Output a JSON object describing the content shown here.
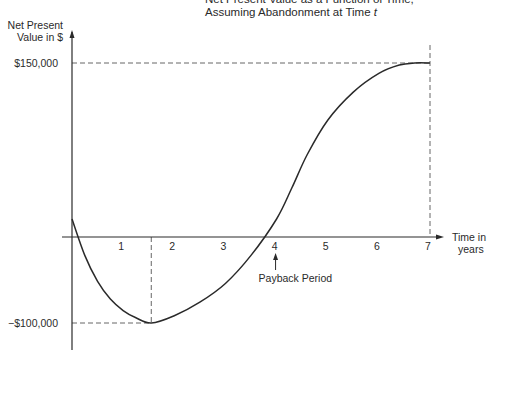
{
  "chart_data": {
    "type": "line",
    "title": "Net Present Value as a Function of Time,",
    "title_line2": "Assuming Abandonment at Time ",
    "title_var": "t",
    "ylabel_line1": "Net Present",
    "ylabel_line2": "Value in $",
    "xlabel_line1": "Time in",
    "xlabel_line2": "years",
    "xlim": [
      0,
      7
    ],
    "ylim": [
      -100000,
      150000
    ],
    "x_ticks": [
      1,
      2,
      3,
      4,
      5,
      6,
      7
    ],
    "x_tick_labels": [
      "1",
      "2",
      "3",
      "4",
      "5",
      "6",
      "7"
    ],
    "y_tick_labels": [
      {
        "value": 150000,
        "label": "$150,000"
      },
      {
        "value": -100000,
        "label": "−$100,000"
      }
    ],
    "series": [
      {
        "name": "Net Present Value",
        "x": [
          0,
          0.25,
          0.5,
          0.75,
          1.0,
          1.25,
          1.55,
          2.0,
          2.5,
          3.0,
          3.5,
          4.0,
          4.3,
          4.6,
          5.0,
          5.5,
          6.0,
          6.4,
          6.7,
          7.0
        ],
        "y": [
          0,
          -35000,
          -60000,
          -77000,
          -88000,
          -95000,
          -100000,
          -93000,
          -80000,
          -62000,
          -35000,
          0,
          30000,
          62000,
          95000,
          122000,
          140000,
          148000,
          150000,
          150000
        ]
      }
    ],
    "reference_lines": [
      {
        "type": "horizontal",
        "value": 150000,
        "style": "dashed"
      },
      {
        "type": "horizontal",
        "value": -100000,
        "style": "dashed"
      },
      {
        "type": "vertical",
        "value": 1.55,
        "style": "dashed"
      },
      {
        "type": "vertical",
        "value": 7,
        "style": "dashed"
      }
    ],
    "annotations": [
      {
        "text": "Payback Period",
        "x": 4,
        "arrow": "up"
      }
    ],
    "grid": false,
    "legend": "none"
  }
}
